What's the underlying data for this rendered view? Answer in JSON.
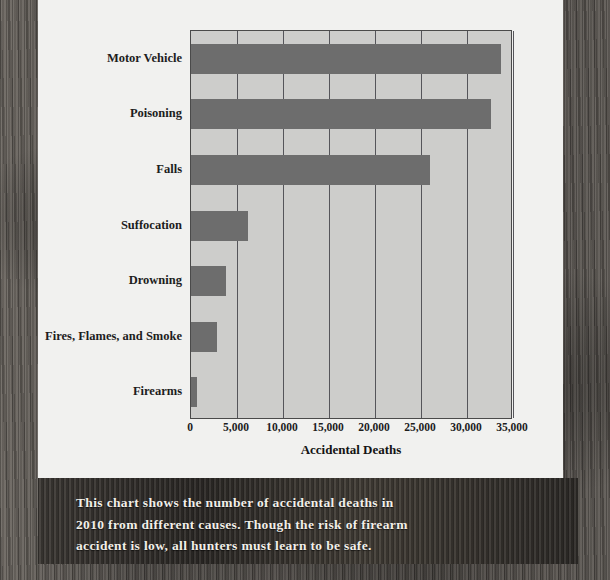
{
  "chart_data": {
    "type": "bar",
    "orientation": "horizontal",
    "title": "",
    "xlabel": "Accidental Deaths",
    "ylabel": "",
    "categories": [
      "Motor Vehicle",
      "Poisoning",
      "Falls",
      "Suffocation",
      "Drowning",
      "Fires, Flames, and Smoke",
      "Firearms"
    ],
    "values": [
      33700,
      32600,
      26000,
      6200,
      3800,
      2800,
      600
    ],
    "xlim": [
      0,
      35000
    ],
    "xticks": [
      0,
      5000,
      10000,
      15000,
      20000,
      25000,
      30000,
      35000
    ],
    "xticklabels": [
      "0",
      "5,000",
      "10,000",
      "15,000",
      "20,000",
      "25,000",
      "30,000",
      "35,000"
    ],
    "grid": true,
    "grid_axis": "x",
    "legend": false,
    "bar_color": "#6d6d6d",
    "plot_background": "#cdcdcb",
    "panel_background": "#f1f1ef"
  },
  "caption": {
    "lines": [
      "This chart shows the number of accidental deaths in",
      "2010 from different causes. Though the risk of firearm",
      "accident is low, all hunters must learn to be safe."
    ]
  }
}
